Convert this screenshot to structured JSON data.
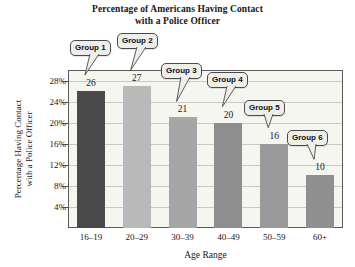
{
  "chart_data": {
    "type": "bar",
    "title": "Percentage of Americans Having Contact with a Police Officer",
    "title_line1": "Percentage of Americans Having Contact",
    "title_line2": "with a Police Officer",
    "xlabel": "Age Range",
    "ylabel": "Percentage Having Contact with a Police Officer",
    "ylabel_line1": "Percentage Having Contact",
    "ylabel_line2": "with a Police Officer",
    "categories": [
      "16–19",
      "20–29",
      "30–39",
      "40–49",
      "50–59",
      "60+"
    ],
    "values": [
      26,
      27,
      21,
      20,
      16,
      10
    ],
    "value_labels": [
      "26",
      "27",
      "21",
      "20",
      "16",
      "10"
    ],
    "ylim": [
      0,
      30
    ],
    "yticks": [
      4,
      8,
      12,
      16,
      20,
      24,
      28
    ],
    "ytick_labels": [
      "4%",
      "8%",
      "12%",
      "16%",
      "20%",
      "24%",
      "28%"
    ],
    "grid": true,
    "legend": "none",
    "annotations": [
      {
        "text": "Group 1",
        "target_category": "16–19"
      },
      {
        "text": "Group 2",
        "target_category": "20–29"
      },
      {
        "text": "Group 3",
        "target_category": "30–39"
      },
      {
        "text": "Group 4",
        "target_category": "40–49"
      },
      {
        "text": "Group 5",
        "target_category": "50–59"
      },
      {
        "text": "Group 6",
        "target_category": "60+"
      }
    ],
    "bar_colors": [
      "#4a4a4a",
      "#b9b9b9",
      "#a6a6a6",
      "#8e8e8e",
      "#9a9a9a",
      "#8f8f8f"
    ],
    "plot_background": "#f6f6f1",
    "grid_color": "#c9c9c2",
    "axis_color": "#5a5a5a",
    "text_color": "#16161a",
    "callout_background": "#efefea",
    "callout_border": "#4a4a4a"
  }
}
